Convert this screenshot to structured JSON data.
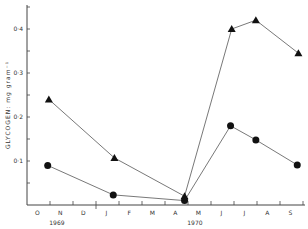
{
  "chart_data": {
    "type": "line",
    "title": "",
    "xlabel": "",
    "ylabel": "GLYCOGEN: mg gram⁻¹",
    "ylim": [
      0,
      0.45
    ],
    "yticks": [
      0.1,
      0.2,
      0.3,
      0.4
    ],
    "ytick_labels": [
      "0·1",
      "0·2",
      "0·3",
      "0·4"
    ],
    "grid": false,
    "legend": null,
    "x_months": [
      "O",
      "N",
      "D",
      "J",
      "F",
      "M",
      "A",
      "M",
      "J",
      "J",
      "A",
      "S"
    ],
    "x_year_labels": [
      {
        "label": "1969",
        "under_month_index": 1
      },
      {
        "label": "1970",
        "under_month_index": 7
      }
    ],
    "series": [
      {
        "name": "triangle",
        "marker": "triangle",
        "points": [
          {
            "x": "mid-Nov 1969",
            "month_pos": 0.95,
            "y": 0.24
          },
          {
            "x": "early Feb 1970",
            "month_pos": 3.8,
            "y": 0.107
          },
          {
            "x": "late Apr 1970",
            "month_pos": 6.85,
            "y": 0.02
          },
          {
            "x": "early Jun 1970",
            "month_pos": 8.9,
            "y": 0.4
          },
          {
            "x": "early Jul 1970",
            "month_pos": 9.95,
            "y": 0.42
          },
          {
            "x": "end Aug 1970",
            "month_pos": 11.8,
            "y": 0.345
          }
        ]
      },
      {
        "name": "circle",
        "marker": "circle",
        "points": [
          {
            "x": "mid-Nov 1969",
            "month_pos": 0.9,
            "y": 0.09
          },
          {
            "x": "early Feb 1970",
            "month_pos": 3.75,
            "y": 0.023
          },
          {
            "x": "late Apr 1970",
            "month_pos": 6.85,
            "y": 0.01
          },
          {
            "x": "early Jun 1970",
            "month_pos": 8.85,
            "y": 0.18
          },
          {
            "x": "early Jul 1970",
            "month_pos": 9.95,
            "y": 0.148
          },
          {
            "x": "end Aug 1970",
            "month_pos": 11.75,
            "y": 0.091
          }
        ]
      }
    ]
  }
}
